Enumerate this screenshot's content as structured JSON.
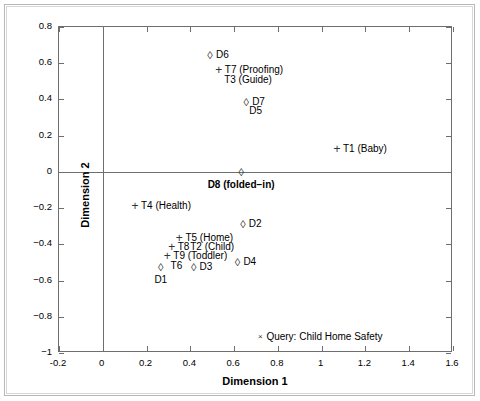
{
  "chart_data": {
    "type": "scatter",
    "title": "",
    "xlabel": "Dimension 1",
    "ylabel": "Dimension 2",
    "xlim": [
      -0.2,
      1.6
    ],
    "ylim": [
      -1,
      0.8
    ],
    "xticks": [
      "-0.2",
      "0",
      "0.2",
      "0.4",
      "0.6",
      "0.8",
      "1",
      "1.2",
      "1.4",
      "1.6"
    ],
    "xtick_values": [
      -0.2,
      0,
      0.2,
      0.4,
      0.6,
      0.8,
      1.0,
      1.2,
      1.4,
      1.6
    ],
    "yticks": [
      "0.8",
      "0.6",
      "0.4",
      "0.2",
      "0",
      "-0.2",
      "-0.4",
      "-0.6",
      "-0.8",
      "-1"
    ],
    "ytick_values": [
      0.8,
      0.6,
      0.4,
      0.2,
      0,
      -0.2,
      -0.4,
      -0.6,
      -0.8,
      -1.0
    ],
    "grid": false,
    "legend": "none",
    "origin_lines": true,
    "points": [
      {
        "label": "D6",
        "marker": "diamond",
        "x": 0.49,
        "y": 0.645,
        "label_side": "right"
      },
      {
        "label": "T7 (Proofing)",
        "marker": "plus",
        "x": 0.53,
        "y": 0.565,
        "label_side": "right"
      },
      {
        "label": "T3 (Guide)",
        "marker": "none",
        "x": 0.55,
        "y": 0.51,
        "label_side": "right"
      },
      {
        "label": "D7",
        "marker": "diamond",
        "x": 0.655,
        "y": 0.385,
        "label_side": "right"
      },
      {
        "label": "D5",
        "marker": "none",
        "x": 0.665,
        "y": 0.335,
        "label_side": "right"
      },
      {
        "label": "T1 (Baby)",
        "marker": "plus",
        "x": 1.07,
        "y": 0.125,
        "label_side": "right"
      },
      {
        "label": "D8 (folded-in)",
        "marker": "diamond",
        "x": 0.632,
        "y": 0.0,
        "label_side": "below",
        "bold": true
      },
      {
        "label": "T4 (Health)",
        "marker": "plus",
        "x": 0.147,
        "y": -0.19,
        "label_side": "right"
      },
      {
        "label": "D2",
        "marker": "diamond",
        "x": 0.64,
        "y": -0.285,
        "label_side": "right"
      },
      {
        "label": "T5 (Home)",
        "marker": "plus",
        "x": 0.35,
        "y": -0.365,
        "label_side": "right"
      },
      {
        "label": "T8",
        "marker": "plus",
        "x": 0.315,
        "y": -0.415,
        "label_side": "right"
      },
      {
        "label": "T2 (Child)",
        "marker": "none",
        "x": 0.395,
        "y": -0.415,
        "label_side": "right"
      },
      {
        "label": "T9 (Toddler)",
        "marker": "plus",
        "x": 0.295,
        "y": -0.465,
        "label_side": "right"
      },
      {
        "label": "T6",
        "marker": "none",
        "x": 0.305,
        "y": -0.52,
        "label_side": "right"
      },
      {
        "label": "D1",
        "marker": "diamond",
        "x": 0.265,
        "y": -0.525,
        "label_side": "below"
      },
      {
        "label": "D3",
        "marker": "diamond",
        "x": 0.415,
        "y": -0.525,
        "label_side": "right"
      },
      {
        "label": "D4",
        "marker": "diamond",
        "x": 0.615,
        "y": -0.495,
        "label_side": "right"
      },
      {
        "label": "Query: Child Home Safety",
        "marker": "cross",
        "x": 0.72,
        "y": -0.91,
        "label_side": "right"
      }
    ]
  },
  "figure": {
    "marker_glyphs": {
      "diamond": "◊",
      "plus": "+",
      "cross": "×",
      "none": ""
    }
  }
}
